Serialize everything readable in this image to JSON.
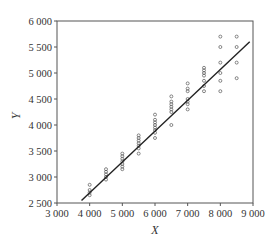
{
  "chart_data": {
    "type": "scatter",
    "title": "",
    "xlabel": "X",
    "ylabel": "Y",
    "xlim": [
      3000,
      9000
    ],
    "ylim": [
      2500,
      6000
    ],
    "xticks": [
      3000,
      4000,
      5000,
      6000,
      7000,
      8000,
      9000
    ],
    "xtick_labels": [
      "3 000",
      "4 000",
      "5 000",
      "6 000",
      "7 000",
      "8 000",
      "9 000"
    ],
    "yticks": [
      2500,
      3000,
      3500,
      4000,
      4500,
      5000,
      5500,
      6000
    ],
    "ytick_labels": [
      "2 500",
      "3 000",
      "3 500",
      "4 000",
      "4 500",
      "5 000",
      "5 500",
      "6 000"
    ],
    "grid": false,
    "legend": null,
    "series": [
      {
        "name": "observations",
        "marker": "open-circle",
        "color": "#555555",
        "points": [
          [
            4000,
            2650
          ],
          [
            4000,
            2700
          ],
          [
            4000,
            2750
          ],
          [
            4000,
            2850
          ],
          [
            4500,
            2950
          ],
          [
            4500,
            3000
          ],
          [
            4500,
            3050
          ],
          [
            4500,
            3100
          ],
          [
            4500,
            3150
          ],
          [
            5000,
            3150
          ],
          [
            5000,
            3200
          ],
          [
            5000,
            3250
          ],
          [
            5000,
            3300
          ],
          [
            5000,
            3350
          ],
          [
            5000,
            3400
          ],
          [
            5000,
            3450
          ],
          [
            5500,
            3450
          ],
          [
            5500,
            3550
          ],
          [
            5500,
            3600
          ],
          [
            5500,
            3650
          ],
          [
            5500,
            3700
          ],
          [
            5500,
            3750
          ],
          [
            5500,
            3800
          ],
          [
            6000,
            3750
          ],
          [
            6000,
            3850
          ],
          [
            6000,
            3900
          ],
          [
            6000,
            3950
          ],
          [
            6000,
            4000
          ],
          [
            6000,
            4050
          ],
          [
            6000,
            4100
          ],
          [
            6000,
            4200
          ],
          [
            6500,
            4000
          ],
          [
            6500,
            4250
          ],
          [
            6500,
            4300
          ],
          [
            6500,
            4350
          ],
          [
            6500,
            4400
          ],
          [
            6500,
            4450
          ],
          [
            6500,
            4550
          ],
          [
            7000,
            4300
          ],
          [
            7000,
            4400
          ],
          [
            7000,
            4450
          ],
          [
            7000,
            4500
          ],
          [
            7000,
            4650
          ],
          [
            7000,
            4700
          ],
          [
            7000,
            4800
          ],
          [
            7500,
            4650
          ],
          [
            7500,
            4750
          ],
          [
            7500,
            4850
          ],
          [
            7500,
            4950
          ],
          [
            7500,
            5000
          ],
          [
            7500,
            5050
          ],
          [
            7500,
            5100
          ],
          [
            8000,
            4650
          ],
          [
            8000,
            4850
          ],
          [
            8000,
            5000
          ],
          [
            8000,
            5200
          ],
          [
            8000,
            5500
          ],
          [
            8000,
            5700
          ],
          [
            8500,
            4900
          ],
          [
            8500,
            5200
          ],
          [
            8500,
            5500
          ],
          [
            8500,
            5700
          ]
        ]
      },
      {
        "name": "fitted line",
        "type": "line",
        "color": "#222222",
        "points": [
          [
            3750,
            2550
          ],
          [
            8900,
            5600
          ]
        ]
      }
    ]
  }
}
